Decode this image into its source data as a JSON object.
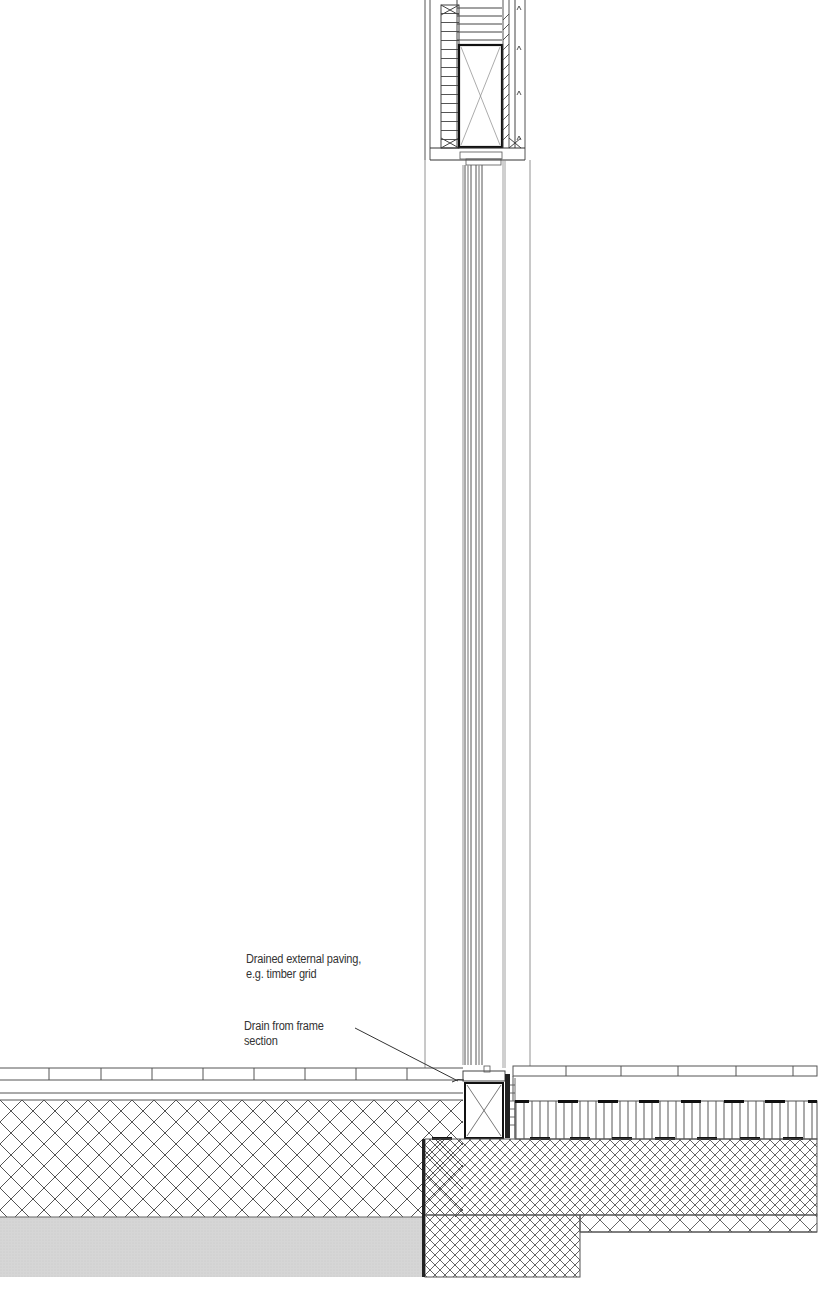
{
  "drawing": {
    "type": "architectural section detail",
    "subject": "Full-height glazing threshold at external paving",
    "colors": {
      "line": "#333333",
      "thin_line": "#666666",
      "hatch": "#555555",
      "ground_fill": "#d9d9d9",
      "background": "#ffffff"
    }
  },
  "annotations": [
    {
      "id": "paving",
      "lines": [
        "Drained external paving,",
        "e.g. timber grid"
      ]
    },
    {
      "id": "drain",
      "lines": [
        "Drain from frame",
        "section"
      ]
    }
  ],
  "components": [
    {
      "name": "lintel-head-box",
      "label": "Head frame / lintel"
    },
    {
      "name": "glazing-unit",
      "label": "Glazed panel"
    },
    {
      "name": "threshold-sill-box",
      "label": "Sill timber"
    },
    {
      "name": "external-paving",
      "label": "Timber grid paving"
    },
    {
      "name": "internal-floor-finish",
      "label": "Floor finish"
    },
    {
      "name": "insulation-layer",
      "label": "Insulation"
    },
    {
      "name": "concrete-slab",
      "label": "Slab"
    },
    {
      "name": "ground-fill",
      "label": "Ground"
    }
  ]
}
